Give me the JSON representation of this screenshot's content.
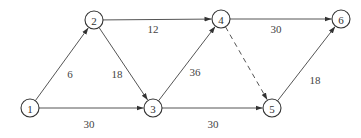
{
  "diagram": {
    "type": "directed-weighted-network",
    "nodes": [
      {
        "id": "1",
        "label": "1",
        "x": 30,
        "y": 108
      },
      {
        "id": "2",
        "label": "2",
        "x": 94,
        "y": 20
      },
      {
        "id": "3",
        "label": "3",
        "x": 153,
        "y": 108
      },
      {
        "id": "4",
        "label": "4",
        "x": 221,
        "y": 19
      },
      {
        "id": "5",
        "label": "5",
        "x": 272,
        "y": 108
      },
      {
        "id": "6",
        "label": "6",
        "x": 341,
        "y": 19
      }
    ],
    "edges": [
      {
        "from": "1",
        "to": "2",
        "weight": "6",
        "style": "solid",
        "label_x": 70,
        "label_y": 74
      },
      {
        "from": "1",
        "to": "3",
        "weight": "30",
        "style": "solid",
        "label_x": 89,
        "label_y": 124
      },
      {
        "from": "2",
        "to": "3",
        "weight": "18",
        "style": "solid",
        "label_x": 117,
        "label_y": 74
      },
      {
        "from": "2",
        "to": "4",
        "weight": "12",
        "style": "solid",
        "label_x": 153,
        "label_y": 29
      },
      {
        "from": "3",
        "to": "4",
        "weight": "36",
        "style": "solid",
        "label_x": 195,
        "label_y": 72
      },
      {
        "from": "3",
        "to": "5",
        "weight": "30",
        "style": "solid",
        "label_x": 213,
        "label_y": 124
      },
      {
        "from": "4",
        "to": "6",
        "weight": "30",
        "style": "solid",
        "label_x": 276,
        "label_y": 29
      },
      {
        "from": "4",
        "to": "5",
        "weight": "",
        "style": "dashed",
        "label_x": null,
        "label_y": null
      },
      {
        "from": "5",
        "to": "6",
        "weight": "18",
        "style": "solid",
        "label_x": 315,
        "label_y": 80
      }
    ],
    "node_radius": 9,
    "colors": {
      "edge": "#555555",
      "node_stroke": "#333333",
      "text": "#333333",
      "background": "#ffffff"
    }
  }
}
